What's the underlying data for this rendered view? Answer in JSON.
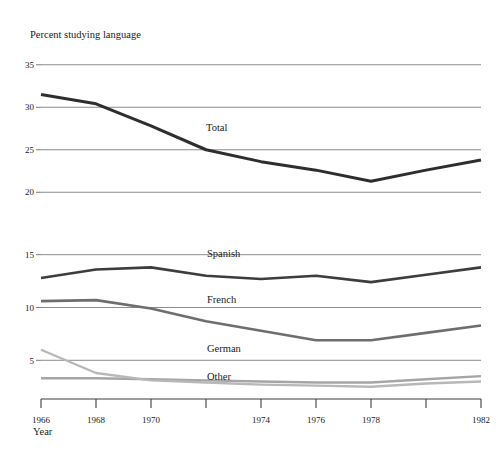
{
  "chart_data": {
    "type": "line",
    "title": "Percent studying language",
    "ylabel": "Percent studying language",
    "xlabel": "Year",
    "grid": true,
    "legend_position": "inline-right-of-series",
    "x": [
      1966,
      1968,
      1970,
      1972,
      1974,
      1976,
      1978,
      1980,
      1982
    ],
    "xlim": [
      1966,
      1982
    ],
    "xtick_values": [
      1966,
      1968,
      1970,
      1972,
      1974,
      1976,
      1978,
      1980,
      1982
    ],
    "xtick_labels": [
      "1966",
      "1968",
      "1970",
      "",
      "1974",
      "1976",
      "1978",
      "",
      "1982"
    ],
    "panels": [
      {
        "name": "total-panel",
        "ylim": [
          18.5,
          36.5
        ],
        "ytick_values": [
          35,
          30,
          25,
          20
        ],
        "ytick_labels": [
          "35",
          "30",
          "25",
          "20"
        ],
        "series": [
          {
            "name": "Total",
            "label": "Total",
            "color": "#2e2e2e",
            "width": 3.0,
            "values": [
              31.5,
              30.4,
              27.8,
              25.0,
              23.6,
              22.6,
              21.3,
              22.6,
              23.8
            ]
          }
        ]
      },
      {
        "name": "languages-panel",
        "ylim": [
          2.0,
          16.2
        ],
        "ytick_values": [
          15,
          10,
          5
        ],
        "ytick_labels": [
          "15",
          "10",
          "5"
        ],
        "series": [
          {
            "name": "Spanish",
            "label": "Spanish",
            "color": "#3d3d3d",
            "width": 2.6,
            "values": [
              12.8,
              13.6,
              13.8,
              13.0,
              12.7,
              13.0,
              12.4,
              13.1,
              13.8
            ]
          },
          {
            "name": "French",
            "label": "French",
            "color": "#6e6e6e",
            "width": 2.6,
            "values": [
              10.6,
              10.7,
              9.9,
              8.7,
              7.8,
              6.9,
              6.9,
              7.6,
              8.3
            ]
          },
          {
            "name": "German",
            "label": "German",
            "color": "#a5a5a5",
            "width": 2.4,
            "values": [
              3.3,
              3.3,
              3.2,
              3.1,
              3.0,
              2.9,
              2.9,
              3.2,
              3.5
            ]
          },
          {
            "name": "Other",
            "label": "Other",
            "color": "#b8b8b8",
            "width": 2.4,
            "values": [
              6.0,
              3.8,
              3.1,
              2.9,
              2.7,
              2.6,
              2.5,
              2.8,
              3.0
            ]
          }
        ]
      }
    ],
    "annotations": [
      {
        "text": "Total",
        "x": 1972.1,
        "panel": 0,
        "anchor": "x:206,y:131"
      },
      {
        "text": "Spanish",
        "x": 1972.6,
        "panel": 1,
        "anchor": "x:207,y:257"
      },
      {
        "text": "French",
        "x": 1972.6,
        "panel": 1,
        "anchor": "x:207,y:303"
      },
      {
        "text": "German",
        "x": 1972.6,
        "panel": 1,
        "anchor": "x:207,y:352"
      },
      {
        "text": "Other",
        "x": 1972.6,
        "panel": 1,
        "anchor": "x:207,y:380"
      }
    ]
  }
}
